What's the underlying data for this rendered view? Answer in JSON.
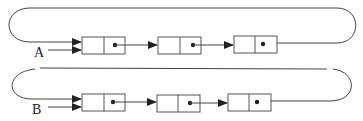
{
  "diagram": {
    "type": "circular-linked-lists",
    "colors": {
      "line": "#444444",
      "node_border": "#555555",
      "background": "#ffffff"
    },
    "lists": [
      {
        "label": "A",
        "nodes": [
          {
            "index": 0,
            "fields": [
              "data",
              "next"
            ],
            "next_has_pointer": true
          },
          {
            "index": 1,
            "fields": [
              "data",
              "next"
            ],
            "next_has_pointer": true
          },
          {
            "index": 2,
            "fields": [
              "data",
              "next"
            ],
            "next_has_pointer": true
          }
        ],
        "last_points_to": "first node (circular)"
      },
      {
        "label": "B",
        "nodes": [
          {
            "index": 0,
            "fields": [
              "data",
              "next"
            ],
            "next_has_pointer": true
          },
          {
            "index": 1,
            "fields": [
              "data",
              "next"
            ],
            "next_has_pointer": true
          },
          {
            "index": 2,
            "fields": [
              "data",
              "next"
            ],
            "next_has_pointer": true
          }
        ],
        "last_points_to": "first node (circular)"
      }
    ]
  }
}
